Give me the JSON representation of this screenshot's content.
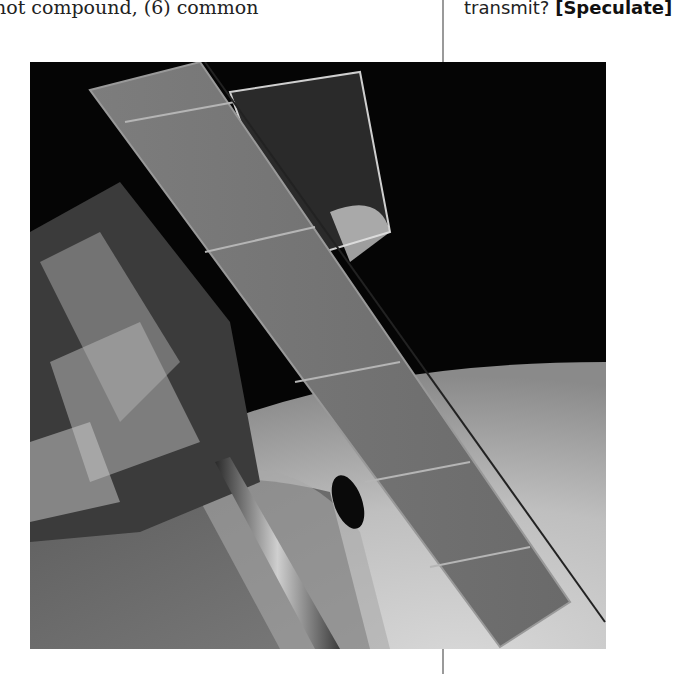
{
  "page": {
    "left_column": {
      "text_fragment": "not compound, (6) common"
    },
    "right_column": {
      "text_fragment": "transmit?",
      "tag": "[Speculate]"
    },
    "figure": {
      "description": "Black-and-white photograph of the Hubble Space Telescope with a solar panel array in orbit above Earth",
      "icon": "photo-image"
    }
  }
}
